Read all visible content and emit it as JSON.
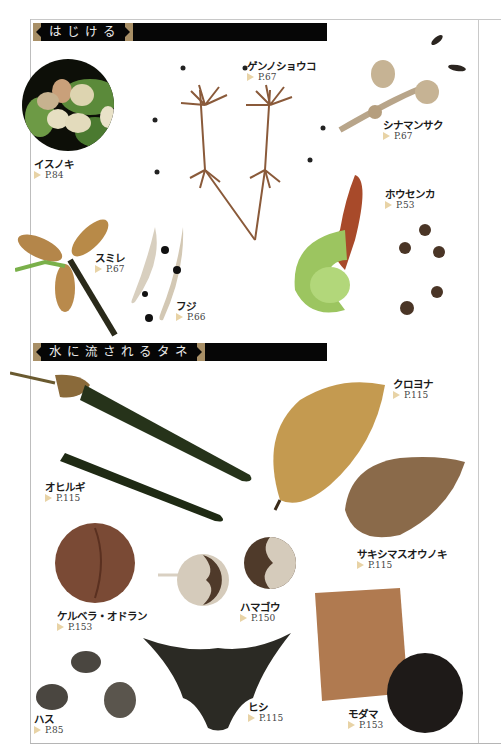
{
  "sections": [
    {
      "title": "はじける"
    },
    {
      "title": "水に流されるタネ"
    }
  ],
  "specimens": {
    "isunoki": {
      "name": "イスノキ",
      "page": "P.84"
    },
    "gennoshoko": {
      "name": "ゲンノショウコ",
      "page": "P.67"
    },
    "shinamansaku": {
      "name": "シナマンサク",
      "page": "P.67"
    },
    "housenka": {
      "name": "ホウセンカ",
      "page": "P.53"
    },
    "sumire": {
      "name": "スミレ",
      "page": "P.67"
    },
    "fuji": {
      "name": "フジ",
      "page": "P.66"
    },
    "kuroyona": {
      "name": "クロヨナ",
      "page": "P.115"
    },
    "ohirugi": {
      "name": "オヒルギ",
      "page": "P.115"
    },
    "sakishimasuounoki": {
      "name": "サキシマスオウノキ",
      "page": "P.115"
    },
    "cerbera": {
      "name": "ケルベラ・オドラン",
      "page": "P.153"
    },
    "hamagou": {
      "name": "ハマゴウ",
      "page": "P.150"
    },
    "hasu": {
      "name": "ハス",
      "page": "P.85"
    },
    "hishi": {
      "name": "ヒシ",
      "page": "P.115"
    },
    "modama": {
      "name": "モダマ",
      "page": "P.153"
    }
  },
  "colors": {
    "header_bg": "#060606",
    "header_ornament": "#a88f66",
    "page_arrow": "#e8d3a6",
    "frame": "#c8c8c8"
  }
}
